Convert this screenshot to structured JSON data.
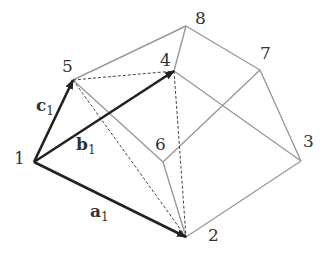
{
  "diagram": {
    "vertices": [
      {
        "id": "1",
        "label": "1",
        "x": 34,
        "y": 162,
        "lx": 14,
        "ly": 150
      },
      {
        "id": "2",
        "label": "2",
        "x": 186,
        "y": 237,
        "lx": 208,
        "ly": 227
      },
      {
        "id": "3",
        "label": "3",
        "x": 301,
        "y": 161,
        "lx": 303,
        "ly": 133
      },
      {
        "id": "4",
        "label": "4",
        "x": 174,
        "y": 71,
        "lx": 160,
        "ly": 52
      },
      {
        "id": "5",
        "label": "5",
        "x": 73,
        "y": 80,
        "lx": 62,
        "ly": 58
      },
      {
        "id": "6",
        "label": "6",
        "x": 163,
        "y": 162,
        "lx": 155,
        "ly": 136
      },
      {
        "id": "7",
        "label": "7",
        "x": 260,
        "y": 70,
        "lx": 260,
        "ly": 45
      },
      {
        "id": "8",
        "label": "8",
        "x": 186,
        "y": 26,
        "lx": 195,
        "ly": 10
      }
    ],
    "vectors": [
      {
        "name": "a",
        "sub": "1",
        "from": "1",
        "to": "2",
        "lx": 90,
        "ly": 203
      },
      {
        "name": "b",
        "sub": "1",
        "from": "1",
        "to": "4",
        "lx": 76,
        "ly": 136
      },
      {
        "name": "c",
        "sub": "1",
        "from": "1",
        "to": "5",
        "lx": 36,
        "ly": 97
      }
    ],
    "edges_solid": [
      [
        "5",
        "8"
      ],
      [
        "8",
        "7"
      ],
      [
        "7",
        "3"
      ],
      [
        "3",
        "2"
      ],
      [
        "8",
        "4"
      ],
      [
        "4",
        "3"
      ],
      [
        "7",
        "6"
      ],
      [
        "6",
        "2"
      ],
      [
        "6",
        "5"
      ]
    ],
    "edges_dashed": [
      [
        "5",
        "4"
      ],
      [
        "4",
        "2"
      ],
      [
        "5",
        "2"
      ]
    ],
    "colors": {
      "vector": "#222222",
      "edge": "#999999",
      "dashed": "#444444"
    }
  }
}
